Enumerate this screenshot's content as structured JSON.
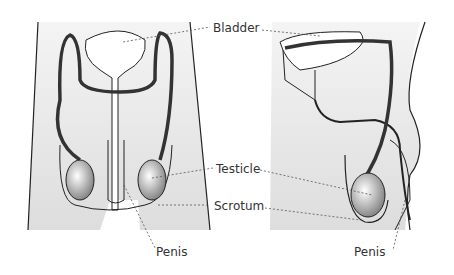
{
  "diagram": {
    "type": "anatomical illustration",
    "views": [
      "front",
      "side"
    ],
    "labels": {
      "bladder": "Bladder",
      "testicle": "Testicle",
      "scrotum": "Scrotum",
      "penis_front": "Penis",
      "penis_side": "Penis"
    },
    "colors": {
      "outline": "#222222",
      "body_fill": "#f0f0f0",
      "duct": "#444444",
      "leader": "#555555",
      "text": "#333333"
    }
  }
}
